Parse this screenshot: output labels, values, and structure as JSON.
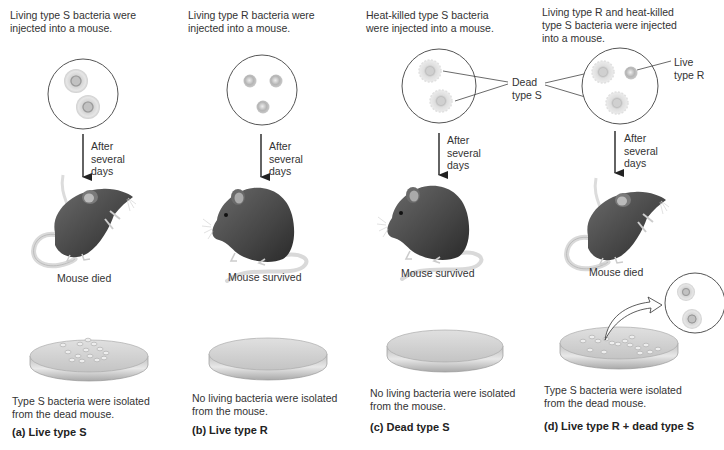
{
  "panels": [
    {
      "id": "a",
      "injection_text": [
        "Living type S bacteria were",
        "injected into a mouse."
      ],
      "after_text": [
        "After",
        "several",
        "days"
      ],
      "outcome": "Mouse died",
      "isolation_text": [
        "Type S bacteria were isolated",
        "from the dead mouse."
      ],
      "label": "(a) Live type S",
      "bacteria": "live-type-s",
      "mouse_state": "died",
      "plate": "colonies"
    },
    {
      "id": "b",
      "injection_text": [
        "Living type R bacteria were",
        "injected into a mouse."
      ],
      "after_text": [
        "After",
        "several",
        "days"
      ],
      "outcome": "Mouse survived",
      "isolation_text": [
        "No living bacteria were isolated",
        "from the mouse."
      ],
      "label": "(b) Live type R",
      "bacteria": "live-type-r",
      "mouse_state": "survived",
      "plate": "empty"
    },
    {
      "id": "c",
      "injection_text": [
        "Heat-killed type S bacteria",
        "were injected into a mouse."
      ],
      "after_text": [
        "After",
        "several",
        "days"
      ],
      "outcome": "Mouse survived",
      "isolation_text": [
        "No living bacteria were isolated",
        "from the mouse."
      ],
      "label": "(c) Dead type S",
      "bacteria": "dead-type-s",
      "mouse_state": "survived",
      "plate": "empty"
    },
    {
      "id": "d",
      "injection_text": [
        "Living type R and heat-killed",
        "type S bacteria were injected",
        "into a mouse."
      ],
      "after_text": [
        "After",
        "several",
        "days"
      ],
      "outcome": "Mouse died",
      "isolation_text": [
        "Type S bacteria were isolated",
        "from the dead mouse."
      ],
      "label": "(d) Live type R + dead type S",
      "bacteria": "mixed",
      "mouse_state": "died",
      "plate": "colonies-with-magnified-inset"
    }
  ],
  "callouts": {
    "dead_type_s": [
      "Dead",
      "type S"
    ],
    "live_type_r": [
      "Live",
      "type R"
    ]
  },
  "colors": {
    "line": "#444444",
    "mouse_body": "#4a4a4a",
    "mouse_tail": "#d8d8d8",
    "plate": "#cfcfcf",
    "bacteria": "#bdbdbd"
  }
}
